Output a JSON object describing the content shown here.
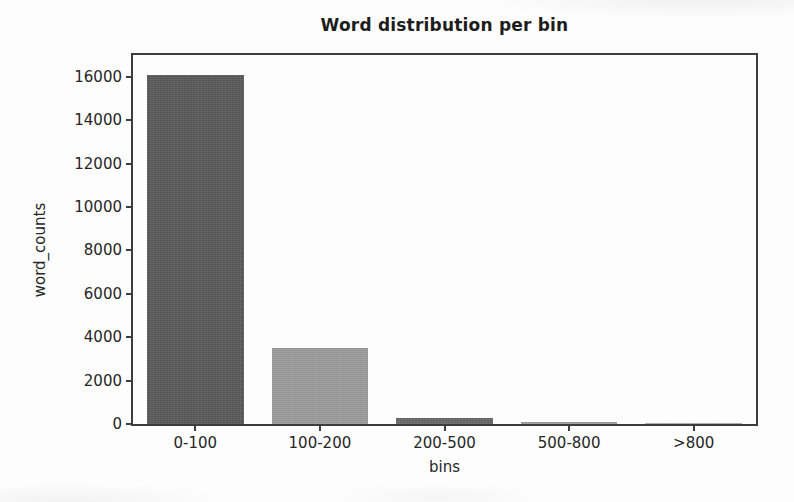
{
  "chart_data": {
    "type": "bar",
    "title": "Word distribution per bin",
    "xlabel": "bins",
    "ylabel": "word_counts",
    "categories": [
      "0-100",
      "100-200",
      "200-500",
      "500-800",
      ">800"
    ],
    "values": [
      16100,
      3500,
      300,
      100,
      30
    ],
    "bar_colors": [
      "#575757",
      "#9a9a9a",
      "#666666",
      "#9d9d9d",
      "#ababab"
    ],
    "ylim": [
      0,
      17000
    ],
    "yticks": [
      0,
      2000,
      4000,
      6000,
      8000,
      10000,
      12000,
      14000,
      16000
    ],
    "grid": false,
    "legend": null,
    "bar_width_fraction": 0.775,
    "spine_color": "#3d3d3d"
  }
}
